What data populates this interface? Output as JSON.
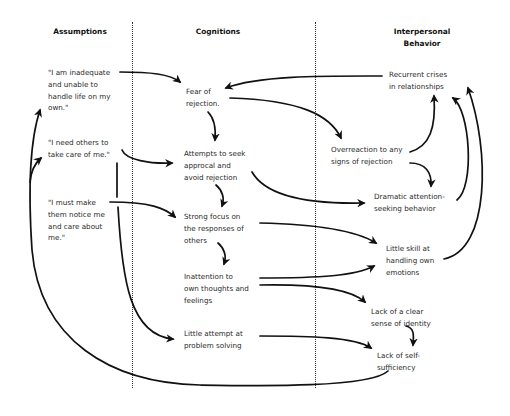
{
  "headers": {
    "assumptions": "Assumptions",
    "cognitions": "Cognitions",
    "interpersonal_1": "Interpersonal",
    "interpersonal_2": "Behavior"
  },
  "assumptions": [
    {
      "text": "\"I am inadequate\nand unable to\nhandle life on my\nown.\""
    },
    {
      "text": "\"I need others to\ntake care of me.\""
    },
    {
      "text": "\"I must make\nthem notice me\nand care about\nme.\""
    }
  ],
  "cognitions": [
    {
      "text": "Fear of\nrejection."
    },
    {
      "text": "Attempts to seek\napprocal and\navoid rejection"
    },
    {
      "text": "Strong focus on\nthe responses of\nothers"
    },
    {
      "text": "Inattention to\nown thoughts and\nfeelings"
    },
    {
      "text": "Little attempt at\nproblem solving"
    }
  ],
  "interpersonal": [
    {
      "text": "Recurrent crises\nin relationships"
    },
    {
      "text": "Overreaction to any\nsigns of rejection"
    },
    {
      "text": "Dramatic attention-\nseeking behavior"
    },
    {
      "text": "Little skill at\nhandling own\nemotions"
    },
    {
      "text": "Lack of a clear\nsense of identity"
    },
    {
      "text": "Lack of self-\nsufficiency"
    }
  ],
  "colors": {
    "line": "#111111",
    "text": "#2a2a2a",
    "background": "#ffffff"
  }
}
